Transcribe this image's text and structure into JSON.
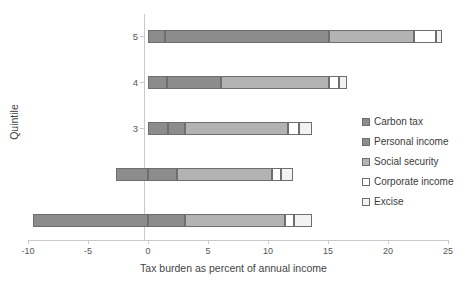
{
  "chart_data": {
    "type": "bar",
    "orientation": "horizontal",
    "stacked": true,
    "title": "",
    "xlabel": "Tax burden as percent of annual income",
    "ylabel": "Quintile",
    "xlim": [
      -10,
      25
    ],
    "ylim": [
      0.5,
      5.5
    ],
    "grid": false,
    "legend_position": "right",
    "xticks": [
      -10,
      -5,
      0,
      5,
      10,
      15,
      20,
      25
    ],
    "xticklabels": [
      "-10",
      "-5",
      "0",
      "5",
      "10",
      "15",
      "20",
      "25"
    ],
    "categories": [
      "1",
      "2",
      "3",
      "4",
      "5"
    ],
    "series": [
      {
        "name": "Carbon tax",
        "color": "#8c8c8c",
        "values": [
          -9.6,
          -2.7,
          1.7,
          1.6,
          1.4
        ]
      },
      {
        "name": "Personal income",
        "color": "#8c8c8c",
        "values": [
          3.1,
          2.4,
          1.4,
          4.5,
          13.7
        ]
      },
      {
        "name": "Social security",
        "color": "#b3b3b3",
        "values": [
          8.3,
          7.9,
          8.6,
          9.0,
          7.1
        ]
      },
      {
        "name": "Corporate income",
        "color": "#ffffff",
        "values": [
          0.8,
          0.8,
          0.9,
          0.8,
          1.8
        ]
      },
      {
        "name": "Excise",
        "color": "#f2f2f2",
        "values": [
          1.5,
          1.0,
          1.1,
          0.7,
          0.5
        ]
      }
    ],
    "segment_bounds": {
      "1": [
        [
          -9.6,
          0.0
        ],
        [
          0.0,
          3.1
        ],
        [
          3.1,
          11.4
        ],
        [
          11.4,
          12.2
        ],
        [
          12.2,
          13.7
        ]
      ],
      "2": [
        [
          -2.7,
          0.0
        ],
        [
          0.0,
          2.4
        ],
        [
          2.4,
          10.3
        ],
        [
          10.3,
          11.1
        ],
        [
          11.1,
          12.1
        ]
      ],
      "3": [
        [
          0.0,
          1.7
        ],
        [
          1.7,
          3.1
        ],
        [
          3.1,
          11.7
        ],
        [
          11.7,
          12.6
        ],
        [
          12.6,
          13.7
        ]
      ],
      "4": [
        [
          0.0,
          1.6
        ],
        [
          1.6,
          6.1
        ],
        [
          6.1,
          15.1
        ],
        [
          15.1,
          15.9
        ],
        [
          15.9,
          16.6
        ]
      ],
      "5": [
        [
          0.0,
          1.4
        ],
        [
          1.4,
          15.1
        ],
        [
          15.1,
          22.2
        ],
        [
          22.2,
          24.0
        ],
        [
          24.0,
          24.5
        ]
      ]
    }
  }
}
